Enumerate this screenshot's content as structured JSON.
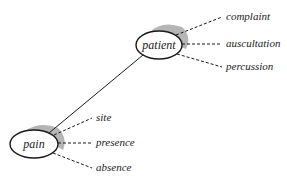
{
  "diagram": {
    "type": "semantic-network",
    "nodes": [
      {
        "id": "patient",
        "label": "patient",
        "cx": 159,
        "cy": 45,
        "rx": 23,
        "ry": 14,
        "attributes": [
          {
            "label": "complaint",
            "x": 226,
            "y": 20
          },
          {
            "label": "auscultation",
            "x": 226,
            "y": 47
          },
          {
            "label": "percussion",
            "x": 226,
            "y": 70
          }
        ]
      },
      {
        "id": "pain",
        "label": "pain",
        "cx": 34,
        "cy": 144,
        "rx": 24,
        "ry": 14,
        "attributes": [
          {
            "label": "site",
            "x": 96,
            "y": 121
          },
          {
            "label": "presence",
            "x": 96,
            "y": 146
          },
          {
            "label": "absence",
            "x": 96,
            "y": 171
          }
        ]
      }
    ],
    "edges": [
      {
        "from": "patient",
        "to": "pain",
        "style": "solid"
      }
    ],
    "colors": {
      "stroke": "#1a1a1a",
      "shade": "#a8a8a8",
      "text": "#222222"
    }
  }
}
